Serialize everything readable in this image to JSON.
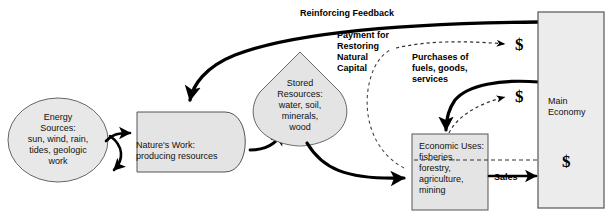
{
  "diagram": {
    "nodes": {
      "energy_sources": {
        "name": "energy-sources",
        "text": "Energy\nSources:\nsun, wind, rain,\ntides, geologic\nwork",
        "shape": "ellipse",
        "fill": "#e8e8e8"
      },
      "natures_work": {
        "name": "natures-work",
        "text": "Nature's Work:\nproducing resources",
        "shape": "rounded-right-rectangle",
        "fill": "#e4e4e4"
      },
      "stored_resources": {
        "name": "stored-resources",
        "text": "Stored\nResources:\nwater, soil,\nminerals,\nwood",
        "shape": "teardrop",
        "fill": "#e4e4e4"
      },
      "economic_uses": {
        "name": "economic-uses",
        "text": "Economic Uses:\nfisheries,\nforestry,\nagriculture,\nmining",
        "shape": "rectangle",
        "fill": "#e4e4e4"
      },
      "main_economy": {
        "name": "main-economy",
        "text": "Main\nEconomy",
        "shape": "rectangle",
        "fill": "#ececec"
      }
    },
    "labels": {
      "reinforcing_feedback": "Reinforcing  Feedback",
      "payment_for_restoring": "Payment for\nRestoring\nNatural\nCapital",
      "purchases": "Purchases of\nfuels, goods,\nservices",
      "sales": "Sales"
    },
    "money_markers": [
      {
        "name": "dollar-payment",
        "symbol": "$"
      },
      {
        "name": "dollar-purchases",
        "symbol": "$"
      },
      {
        "name": "dollar-sales",
        "symbol": "$"
      }
    ],
    "colors": {
      "stroke": "#000000",
      "node_fill": "#e4e4e4",
      "node_stroke": "#555555",
      "background": "#ffffff"
    }
  }
}
